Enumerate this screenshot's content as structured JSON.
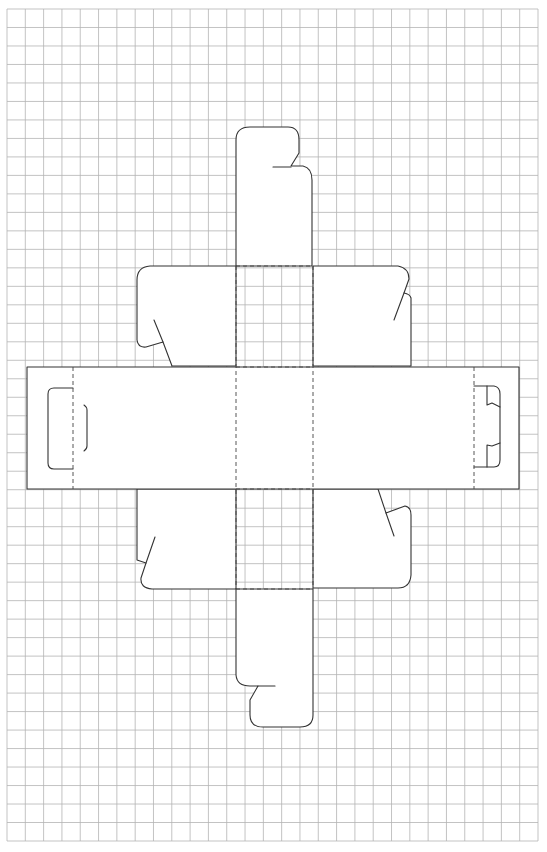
{
  "diagram": {
    "grid": {
      "x": 7,
      "y": 9,
      "width": 531,
      "height": 832,
      "columns": 29,
      "rows": 45,
      "color": "#b4b4b4"
    },
    "colors": {
      "background": "#ffffff",
      "cut_line": "#333333",
      "fold_line": "#444444"
    },
    "legend": {
      "cut_line": "solid line = cut",
      "fold_line": "dashed line = fold"
    },
    "panels": [
      {
        "name": "top-tuck-flap"
      },
      {
        "name": "top-panel"
      },
      {
        "name": "upper-left-dust-flap"
      },
      {
        "name": "upper-right-dust-flap"
      },
      {
        "name": "left-glue-tab"
      },
      {
        "name": "left-side-panel"
      },
      {
        "name": "front-panel"
      },
      {
        "name": "right-side-panel"
      },
      {
        "name": "right-lock-tab"
      },
      {
        "name": "lower-left-dust-flap"
      },
      {
        "name": "lower-right-dust-flap"
      },
      {
        "name": "bottom-panel"
      },
      {
        "name": "bottom-tuck-flap"
      }
    ]
  }
}
